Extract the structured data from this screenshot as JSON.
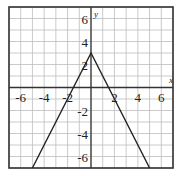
{
  "chart_data": {
    "type": "line",
    "title": "",
    "xlabel": "x",
    "ylabel": "y",
    "xlim": [
      -7,
      7
    ],
    "ylim": [
      -7,
      7
    ],
    "grid": true,
    "grid_step": 1,
    "x_ticks": [
      -6,
      -4,
      -2,
      2,
      4,
      6
    ],
    "y_ticks": [
      -6,
      -4,
      -2,
      2,
      4,
      6
    ],
    "x_tick_labels": [
      "-6",
      "-4",
      "-2",
      "2",
      "4",
      "6"
    ],
    "y_tick_labels": [
      "-6",
      "-4",
      "-2",
      "2",
      "4",
      "6"
    ],
    "series": [
      {
        "name": "y = -2|x| + 3",
        "x": [
          -5,
          0,
          5
        ],
        "y": [
          -7,
          3,
          -7
        ]
      }
    ],
    "colors": {
      "line": "#222222",
      "grid": "#bdbdbd",
      "axis": "#333333",
      "border": "#333333"
    }
  }
}
